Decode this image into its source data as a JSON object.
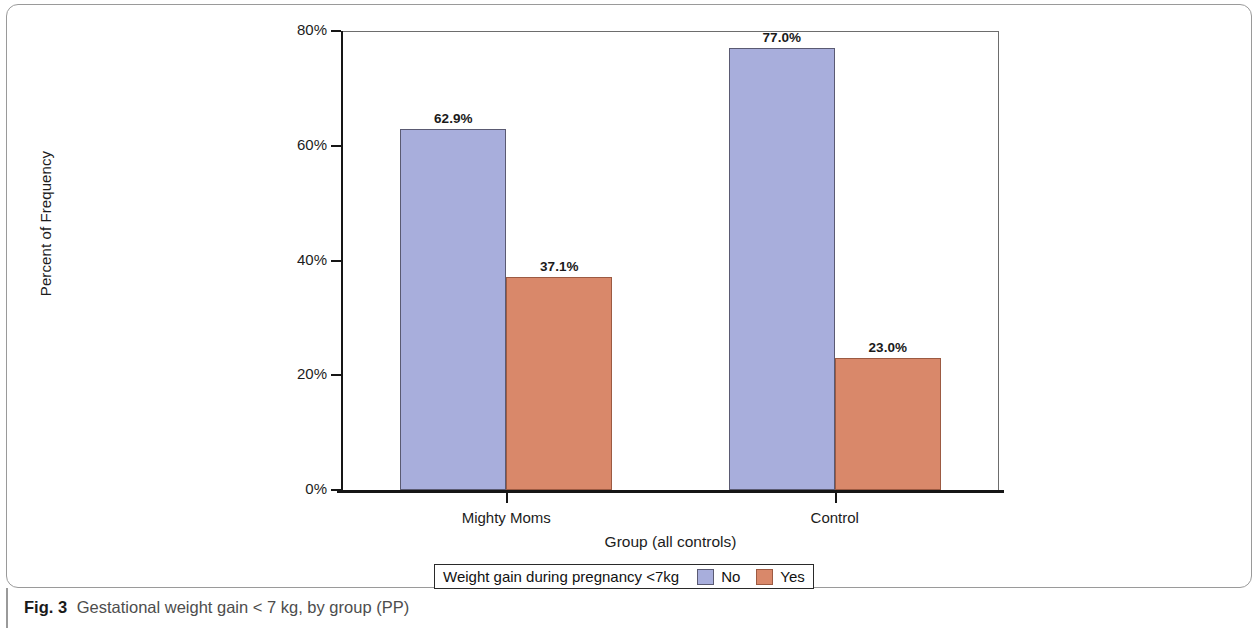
{
  "figure": {
    "caption_label": "Fig. 3",
    "caption_text": "Gestational weight gain < 7 kg, by group (PP)"
  },
  "legend": {
    "title": "Weight gain during pregnancy <7kg",
    "entries": [
      {
        "label": "No",
        "color": "#a8aedc"
      },
      {
        "label": "Yes",
        "color": "#d9886a"
      }
    ]
  },
  "chart_data": {
    "type": "bar",
    "title": "",
    "xlabel": "Group (all controls)",
    "ylabel": "Percent of Frequency",
    "categories": [
      "Mighty Moms",
      "Control"
    ],
    "ylim": [
      0,
      80
    ],
    "yticks": [
      0,
      20,
      40,
      60,
      80
    ],
    "ytick_labels": [
      "0%",
      "20%",
      "40%",
      "60%",
      "80%"
    ],
    "grid": false,
    "legend_position": "bottom",
    "series": [
      {
        "name": "No",
        "color": "#a8aedc",
        "values": [
          62.9,
          77.0
        ],
        "data_labels": [
          "62.9%",
          "77.0%"
        ]
      },
      {
        "name": "Yes",
        "color": "#d9886a",
        "values": [
          37.1,
          23.0
        ],
        "data_labels": [
          "37.1%",
          "23.0%"
        ]
      }
    ]
  }
}
